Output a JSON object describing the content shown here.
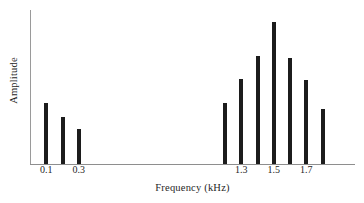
{
  "chart_data": {
    "type": "bar",
    "title": "",
    "xlabel": "Frequency (kHz)",
    "ylabel": "Amplitude",
    "grid": false,
    "legend": null,
    "xlim": [
      0.0,
      2.0
    ],
    "ylim": [
      0,
      100
    ],
    "bar_color": "#1c1c1c",
    "axis_color": "#8e8e8e",
    "x": [
      0.1,
      0.2,
      0.3,
      1.2,
      1.3,
      1.4,
      1.5,
      1.6,
      1.7,
      1.8
    ],
    "values": [
      43,
      33,
      25,
      43,
      60,
      76,
      100,
      75,
      59,
      39
    ],
    "tick_values": [
      0.1,
      0.3,
      1.3,
      1.5,
      1.7
    ],
    "tick_labels": [
      "0.1",
      "0.3",
      "1.3",
      "1.5",
      "1.7"
    ],
    "bars": [
      {
        "label": "0.1",
        "x": 0.1,
        "value": 43
      },
      {
        "label": "0.2",
        "x": 0.2,
        "value": 33
      },
      {
        "label": "0.3",
        "x": 0.3,
        "value": 25
      },
      {
        "label": "1.2",
        "x": 1.2,
        "value": 43
      },
      {
        "label": "1.3",
        "x": 1.3,
        "value": 60
      },
      {
        "label": "1.4",
        "x": 1.4,
        "value": 76
      },
      {
        "label": "1.5",
        "x": 1.5,
        "value": 100
      },
      {
        "label": "1.6",
        "x": 1.6,
        "value": 75
      },
      {
        "label": "1.7",
        "x": 1.7,
        "value": 59
      },
      {
        "label": "1.8",
        "x": 1.8,
        "value": 39
      }
    ]
  }
}
